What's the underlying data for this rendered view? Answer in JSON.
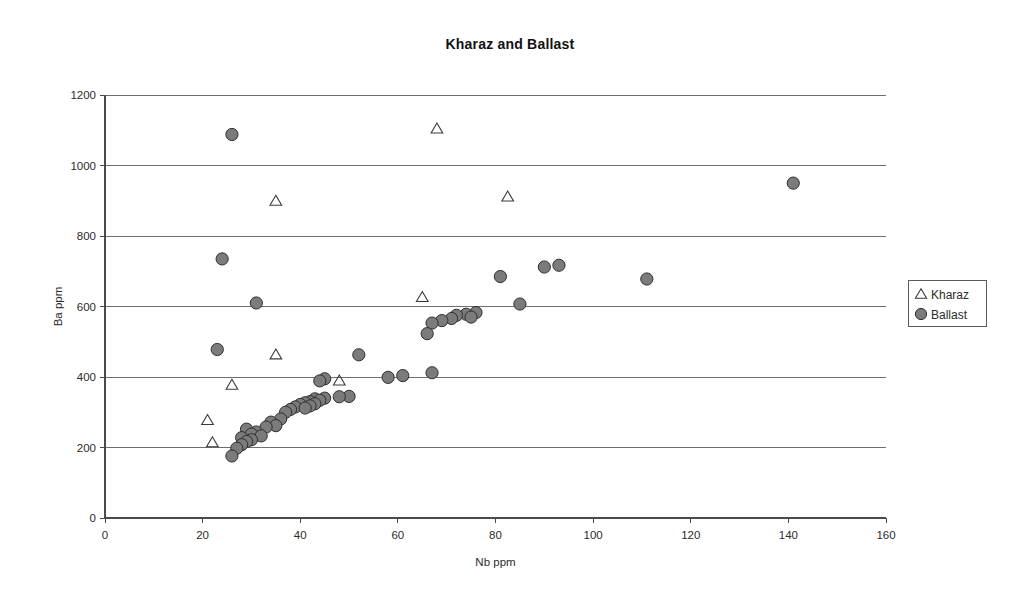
{
  "chart_data": {
    "type": "scatter",
    "title": "Kharaz and Ballast",
    "xlabel": "Nb ppm",
    "ylabel": "Ba ppm",
    "xlim": [
      0,
      160
    ],
    "ylim": [
      0,
      1200
    ],
    "xticks": [
      0,
      20,
      40,
      60,
      80,
      100,
      120,
      140,
      160
    ],
    "yticks": [
      0,
      200,
      400,
      600,
      800,
      1000,
      1200
    ],
    "grid": "horizontal",
    "legend_position": "right",
    "series": [
      {
        "name": "Kharaz",
        "marker": "open-triangle",
        "color": "#3a3a3a",
        "points": [
          [
            68,
            1105
          ],
          [
            35,
            900
          ],
          [
            82.5,
            912
          ],
          [
            65,
            627
          ],
          [
            35,
            464
          ],
          [
            48,
            390
          ],
          [
            26,
            378
          ],
          [
            21,
            278
          ],
          [
            22,
            215
          ]
        ]
      },
      {
        "name": "Ballast",
        "marker": "filled-circle",
        "color": "#7b7b7b",
        "points": [
          [
            26,
            1088
          ],
          [
            141,
            950
          ],
          [
            24,
            735
          ],
          [
            93,
            717
          ],
          [
            90,
            712
          ],
          [
            81,
            685
          ],
          [
            111,
            678
          ],
          [
            31,
            610
          ],
          [
            85,
            607
          ],
          [
            76,
            583
          ],
          [
            74,
            578
          ],
          [
            72,
            575
          ],
          [
            75,
            570
          ],
          [
            71,
            566
          ],
          [
            69,
            560
          ],
          [
            67,
            553
          ],
          [
            66,
            523
          ],
          [
            23,
            478
          ],
          [
            52,
            463
          ],
          [
            67,
            412
          ],
          [
            61,
            404
          ],
          [
            58,
            399
          ],
          [
            45,
            395
          ],
          [
            44,
            389
          ],
          [
            50,
            345
          ],
          [
            48,
            344
          ],
          [
            45,
            340
          ],
          [
            43,
            338
          ],
          [
            44,
            334
          ],
          [
            42,
            330
          ],
          [
            41,
            327
          ],
          [
            43,
            324
          ],
          [
            40,
            322
          ],
          [
            42,
            318
          ],
          [
            39,
            315
          ],
          [
            41,
            312
          ],
          [
            38,
            308
          ],
          [
            37,
            300
          ],
          [
            36,
            281
          ],
          [
            34,
            272
          ],
          [
            35,
            262
          ],
          [
            33,
            258
          ],
          [
            29,
            252
          ],
          [
            31,
            244
          ],
          [
            30,
            238
          ],
          [
            32,
            233
          ],
          [
            28,
            228
          ],
          [
            30,
            222
          ],
          [
            29,
            217
          ],
          [
            28,
            208
          ],
          [
            27,
            198
          ],
          [
            26,
            176
          ]
        ]
      }
    ]
  },
  "legend": {
    "items": [
      {
        "label": "Kharaz",
        "marker": "open-triangle"
      },
      {
        "label": "Ballast",
        "marker": "filled-circle"
      }
    ]
  }
}
